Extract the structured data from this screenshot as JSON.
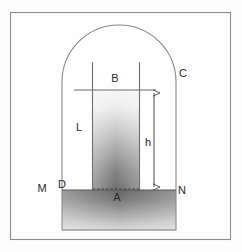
{
  "figure": {
    "frame": {
      "x": 10,
      "y": 12,
      "width": 221,
      "height": 228,
      "stroke": "#8c8c8c",
      "fill": "#fefefe"
    },
    "vessel": {
      "name": "arched-container",
      "left": 62,
      "right": 176,
      "bottom": 230,
      "arch_top": 25,
      "arch_spring": 82,
      "stroke": "#8a8a8a"
    },
    "tube": {
      "name": "capillary-tube",
      "left": 92,
      "right": 140,
      "top": 62,
      "bottom": 190,
      "stroke": "#6f6f6f"
    },
    "liquid_surface_line": {
      "y": 90,
      "x1": 74,
      "x2": 156
    },
    "ground_line": {
      "y": 190,
      "x1": 62,
      "x2": 176
    },
    "dashed_base": {
      "y": 189,
      "x1": 92,
      "x2": 140
    },
    "dimension": {
      "name": "height-dimension",
      "x": 154,
      "y_top": 90,
      "y_bottom": 190
    },
    "colors": {
      "frame_stroke": "#8c8c8c",
      "outline": "#8a8a8a",
      "tube_stroke": "#6f6f6f",
      "liquid_top": "#f4f4f4",
      "liquid_bottom": "#6e6e6e",
      "ground_top": "#6b6b6b",
      "ground_bottom": "#d6d6d6",
      "label_color": "#2b2b2b",
      "background": "#fdfdfd"
    }
  },
  "labels": [
    {
      "id": "B",
      "text": "B",
      "x": 115,
      "y": 82,
      "desc": "tube-interior-upper-label"
    },
    {
      "id": "C",
      "text": "C",
      "x": 183,
      "y": 77,
      "desc": "vessel-wall-label"
    },
    {
      "id": "L",
      "text": "L",
      "x": 79,
      "y": 131,
      "desc": "vessel-interior-label"
    },
    {
      "id": "h",
      "text": "h",
      "x": 148,
      "y": 146,
      "desc": "height-dimension-label"
    },
    {
      "id": "M",
      "text": "M",
      "x": 42,
      "y": 192,
      "desc": "left-ground-label"
    },
    {
      "id": "D",
      "text": "D",
      "x": 62,
      "y": 188,
      "desc": "left-inner-ground-label"
    },
    {
      "id": "A",
      "text": "A",
      "x": 117,
      "y": 201,
      "desc": "tube-base-label"
    },
    {
      "id": "N",
      "text": "N",
      "x": 182,
      "y": 194,
      "desc": "right-ground-label"
    }
  ]
}
